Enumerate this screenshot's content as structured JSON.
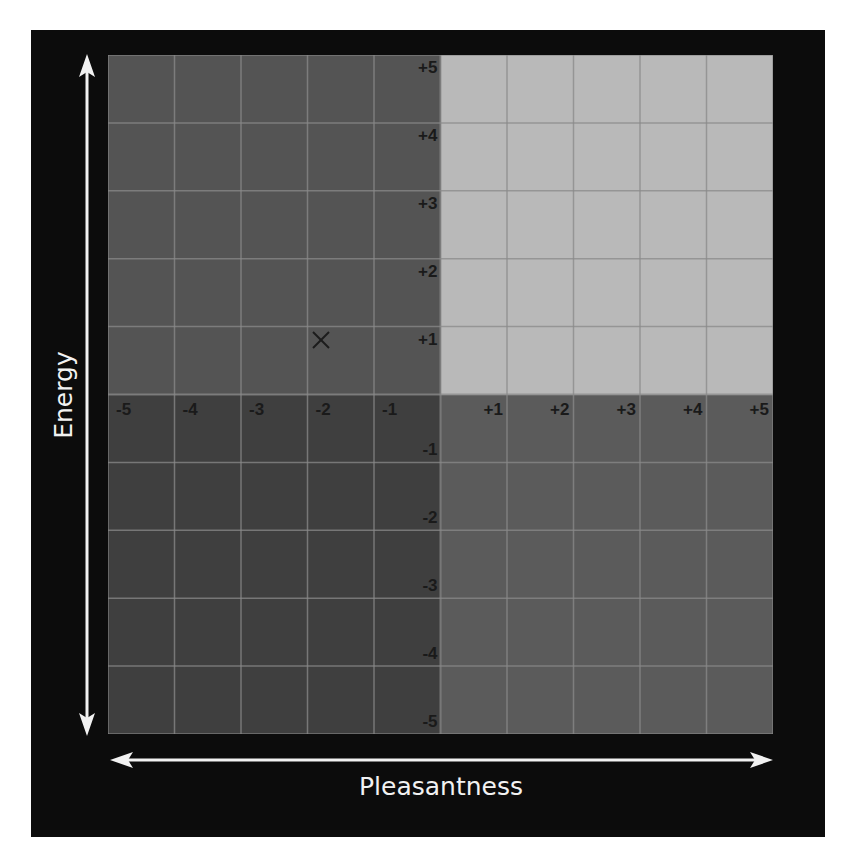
{
  "chart_data": {
    "type": "scatter",
    "title": "",
    "xlabel": "Pleasantness",
    "ylabel": "Energy",
    "xlim": [
      -5,
      5
    ],
    "ylim": [
      -5,
      5
    ],
    "grid": true,
    "x_ticks": [
      "-5",
      "-4",
      "-3",
      "-2",
      "-1",
      "+1",
      "+2",
      "+3",
      "+4",
      "+5"
    ],
    "y_ticks": [
      "+5",
      "+4",
      "+3",
      "+2",
      "+1",
      "-1",
      "-2",
      "-3",
      "-4",
      "-5"
    ],
    "quadrants": [
      {
        "name": "high-energy-unpleasant",
        "x_range": [
          -5,
          0
        ],
        "y_range": [
          0,
          5
        ],
        "color": "#545454"
      },
      {
        "name": "high-energy-pleasant",
        "x_range": [
          0,
          5
        ],
        "y_range": [
          0,
          5
        ],
        "color": "#b9b9b9"
      },
      {
        "name": "low-energy-unpleasant",
        "x_range": [
          -5,
          0
        ],
        "y_range": [
          -5,
          0
        ],
        "color": "#3f3f3f"
      },
      {
        "name": "low-energy-pleasant",
        "x_range": [
          0,
          5
        ],
        "y_range": [
          -5,
          0
        ],
        "color": "#5b5b5b"
      }
    ],
    "points": [
      {
        "x": -1.8,
        "y": 0.8,
        "marker": "x"
      }
    ]
  },
  "labels": {
    "x_axis": "Pleasantness",
    "y_axis": "Energy"
  },
  "colors": {
    "frame": "#0c0c0c",
    "gridline": "#8a8a8a",
    "arrow": "#f2f2f2",
    "tick_text": "#1a1a1a"
  }
}
